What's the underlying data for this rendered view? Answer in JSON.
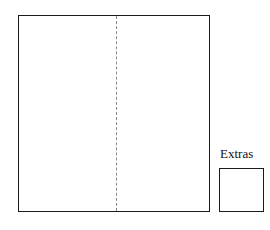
{
  "diagram": {
    "title": "",
    "background_color": "#ffffff",
    "stroke_color": "#1a1a1a",
    "fold_line_color": "#8a8a8a",
    "main_panel": {
      "name": "main-panel",
      "label": "",
      "fill": "#ffffff",
      "fold_line": {
        "name": "center-fold-line",
        "style": "dashed",
        "orientation": "vertical",
        "label": ""
      }
    },
    "extras": {
      "label": "Extras",
      "box_label": "",
      "fill": "#ffffff"
    }
  }
}
